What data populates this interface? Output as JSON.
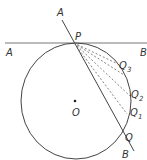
{
  "diagram": {
    "type": "circle-tangent-secant",
    "labels": {
      "A_secant": "A",
      "A_tangent": "A",
      "B_tangent": "B",
      "B_secant": "B",
      "P": "P",
      "O": "O",
      "Q": "Q",
      "Q1": "Q",
      "Q1_sub": "1",
      "Q2": "Q",
      "Q2_sub": "2",
      "Q3": "Q",
      "Q3_sub": "3"
    },
    "colors": {
      "line": "#444444",
      "dashed": "#666666",
      "text": "#333333"
    }
  }
}
